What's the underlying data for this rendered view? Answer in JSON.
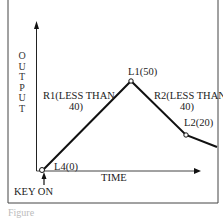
{
  "diagram": {
    "y_axis_label": "OUTPUT",
    "x_axis_label": "TIME",
    "event_label": "KEY ON",
    "points": [
      {
        "id": "L4",
        "label": "L4(0)",
        "value": 0
      },
      {
        "id": "L1",
        "label": "L1(50)",
        "value": 50
      },
      {
        "id": "L2",
        "label": "L2(20)",
        "value": 20
      }
    ],
    "segments": [
      {
        "id": "R1",
        "line1": "R1(LESS THAN",
        "line2": "40)"
      },
      {
        "id": "R2",
        "line1": "R2(LESS THAN",
        "line2": "40)"
      }
    ],
    "caption": "Figure"
  },
  "colors": {
    "line": "#111111",
    "frame": "#333333",
    "text": "#222222"
  }
}
